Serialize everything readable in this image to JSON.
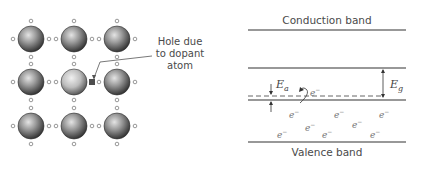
{
  "lattice": {
    "rows": 3,
    "cols": 3,
    "atom_centers_x": [
      31,
      74,
      117
    ],
    "atom_centers_y": [
      39,
      82,
      126
    ],
    "atom_radius": 13,
    "dopant_atom": {
      "row": 1,
      "col": 1
    },
    "annotation": {
      "line1": "Hole due",
      "line2": "to dopant",
      "line3": "atom"
    },
    "colors": {
      "atom_dark": "#3a3a3a",
      "atom_light": "#d8d8d8",
      "dopant_light": "#e6e6e6",
      "hole": "#555555"
    }
  },
  "bands": {
    "conduction_label": "Conduction band",
    "valence_label": "Valence band",
    "acceptor_gap_symbol": "E",
    "acceptor_gap_subscript": "a",
    "band_gap_symbol": "E",
    "band_gap_subscript": "g",
    "electron_symbol": "e",
    "electron_superscript": "−"
  }
}
